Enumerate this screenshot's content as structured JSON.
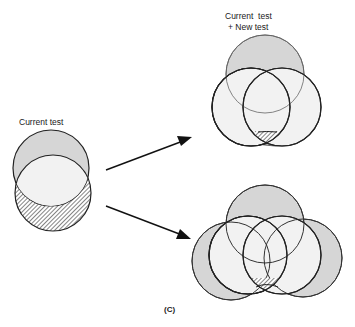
{
  "labels": {
    "current_test": "Current test",
    "combined_line1": "Current  test",
    "combined_line2": "+ New test",
    "panel": "(C)"
  },
  "colors": {
    "gray_fill": "#d6d6d6",
    "light_fill": "#f2f2f2",
    "stroke": "#222222",
    "hatch": "#333333"
  },
  "diagram": {
    "left_cluster": {
      "description": "Current test: two overlapping circles; lower crescent hatched (missed region)"
    },
    "top_right_cluster": {
      "description": "Current test + New test: one gray top circle, two overlapping light circles; small hatched region at bottom"
    },
    "bottom_right_cluster": {
      "description": "Four-circle arrangement: top, left, right gray circles around central overlapping pair; small hatched region at bottom"
    },
    "arrows": [
      "left cluster to top-right cluster",
      "left cluster to bottom-right cluster"
    ]
  }
}
